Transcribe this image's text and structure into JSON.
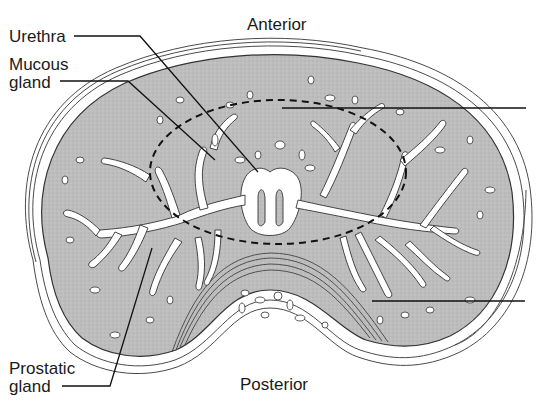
{
  "diagram": {
    "orientation": {
      "top": "Anterior",
      "bottom": "Posterior"
    },
    "labels": {
      "urethra": "Urethra",
      "mucous_gland_line1": "Mucous",
      "mucous_gland_line2": "gland",
      "prostatic_gland_line1": "Prostatic",
      "prostatic_gland_line2": "gland"
    },
    "unlabeled_leaders_right": 2,
    "colors": {
      "tissue": "#b9b9b9",
      "lumen": "#ffffff",
      "outline": "#3a3a3a",
      "text": "#1a1a1a"
    }
  }
}
